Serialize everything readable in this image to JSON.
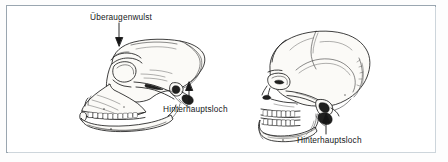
{
  "figure": {
    "kind": "scanned-textbook-illustration",
    "frame_color": "#9aa6b0",
    "background_color": "#ffffff",
    "ink_color": "#1a1a1a"
  },
  "labels": [
    {
      "id": "ueberaugenwulst",
      "text": "Überaugenwulst",
      "target": "ape-skull-brow-ridge",
      "arrow_direction": "down"
    },
    {
      "id": "hinterhauptsloch-ape",
      "text": "Hinterhauptsloch",
      "target": "ape-skull-foramen-magnum",
      "arrow_direction": "up"
    },
    {
      "id": "hinterhauptsloch-human",
      "text": "Hinterhauptsloch",
      "target": "human-skull-foramen-magnum",
      "arrow_direction": "up"
    }
  ],
  "illustrations": [
    {
      "id": "ape-skull",
      "name": "Affenschädel",
      "position": "left"
    },
    {
      "id": "human-skull",
      "name": "Menschenschädel",
      "position": "right"
    }
  ]
}
